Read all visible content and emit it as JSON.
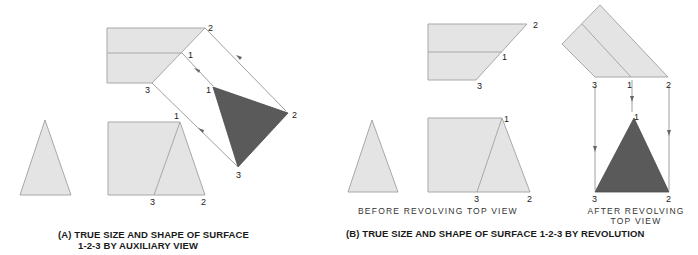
{
  "colors": {
    "light_fill": "#e4e4e4",
    "edge": "#a8a8a8",
    "dark_fill": "#5a5a5a",
    "projection_line": "#777777",
    "text": "#1a1a1a"
  },
  "panel_a": {
    "caption_line1": "(A) TRUE SIZE AND SHAPE OF SURFACE",
    "caption_line2": "1-2-3 BY AUXILIARY VIEW",
    "top_view_labels": {
      "p2": "2",
      "p1": "1",
      "p3": "3"
    },
    "aux_view_labels": {
      "p1": "1",
      "p2": "2",
      "p3": "3"
    },
    "front_view_labels": {
      "p1": "1",
      "p3": "3",
      "p2": "2"
    }
  },
  "panel_b": {
    "caption": "(B) TRUE SIZE AND SHAPE OF SURFACE 1-2-3 BY REVOLUTION",
    "before_label": "BEFORE REVOLVING TOP VIEW",
    "after_label_line1": "AFTER REVOLVING",
    "after_label_line2": "TOP VIEW",
    "top_view_labels": {
      "p2": "2",
      "p1": "1",
      "p3": "3"
    },
    "rotated_top_labels": {
      "p3": "3",
      "p1": "1",
      "p2": "2"
    },
    "true_shape_labels": {
      "p1": "1",
      "p3": "3",
      "p2": "2"
    },
    "front_view_labels": {
      "p1": "1",
      "p3": "3",
      "p2": "2"
    }
  }
}
